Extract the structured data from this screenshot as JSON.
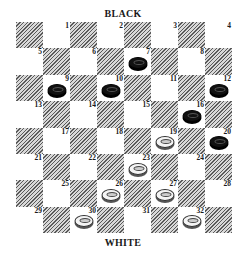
{
  "labels": {
    "top": "BLACK",
    "bottom": "WHITE"
  },
  "board": {
    "size": 8,
    "colors": {
      "dark_hatch": "#5a5a5a",
      "light": "#ffffff",
      "black_piece": "#111111",
      "white_piece": "#f4f4f4"
    },
    "squares": [
      {
        "row": 0,
        "col": 0,
        "dark": true
      },
      {
        "row": 0,
        "col": 1,
        "num": "1"
      },
      {
        "row": 0,
        "col": 2,
        "dark": true
      },
      {
        "row": 0,
        "col": 3,
        "num": "2"
      },
      {
        "row": 0,
        "col": 4,
        "dark": true
      },
      {
        "row": 0,
        "col": 5,
        "num": "3"
      },
      {
        "row": 0,
        "col": 6,
        "dark": true
      },
      {
        "row": 0,
        "col": 7,
        "num": "4"
      },
      {
        "row": 1,
        "col": 0,
        "num": "5"
      },
      {
        "row": 1,
        "col": 1,
        "dark": true
      },
      {
        "row": 1,
        "col": 2,
        "num": "6"
      },
      {
        "row": 1,
        "col": 3,
        "dark": true
      },
      {
        "row": 1,
        "col": 4,
        "num": "7",
        "piece": "black"
      },
      {
        "row": 1,
        "col": 5,
        "dark": true
      },
      {
        "row": 1,
        "col": 6,
        "num": "8"
      },
      {
        "row": 1,
        "col": 7,
        "dark": true
      },
      {
        "row": 2,
        "col": 0,
        "dark": true
      },
      {
        "row": 2,
        "col": 1,
        "num": "9",
        "piece": "black"
      },
      {
        "row": 2,
        "col": 2,
        "dark": true
      },
      {
        "row": 2,
        "col": 3,
        "num": "10",
        "piece": "black"
      },
      {
        "row": 2,
        "col": 4,
        "dark": true
      },
      {
        "row": 2,
        "col": 5,
        "num": "11"
      },
      {
        "row": 2,
        "col": 6,
        "dark": true
      },
      {
        "row": 2,
        "col": 7,
        "num": "12",
        "piece": "black"
      },
      {
        "row": 3,
        "col": 0,
        "num": "13"
      },
      {
        "row": 3,
        "col": 1,
        "dark": true
      },
      {
        "row": 3,
        "col": 2,
        "num": "14"
      },
      {
        "row": 3,
        "col": 3,
        "dark": true
      },
      {
        "row": 3,
        "col": 4,
        "num": "15"
      },
      {
        "row": 3,
        "col": 5,
        "dark": true
      },
      {
        "row": 3,
        "col": 6,
        "num": "16",
        "piece": "black"
      },
      {
        "row": 3,
        "col": 7,
        "dark": true
      },
      {
        "row": 4,
        "col": 0,
        "dark": true
      },
      {
        "row": 4,
        "col": 1,
        "num": "17"
      },
      {
        "row": 4,
        "col": 2,
        "dark": true
      },
      {
        "row": 4,
        "col": 3,
        "num": "18"
      },
      {
        "row": 4,
        "col": 4,
        "dark": true
      },
      {
        "row": 4,
        "col": 5,
        "num": "19",
        "piece": "white"
      },
      {
        "row": 4,
        "col": 6,
        "dark": true
      },
      {
        "row": 4,
        "col": 7,
        "num": "20",
        "piece": "black"
      },
      {
        "row": 5,
        "col": 0,
        "num": "21"
      },
      {
        "row": 5,
        "col": 1,
        "dark": true
      },
      {
        "row": 5,
        "col": 2,
        "num": "22"
      },
      {
        "row": 5,
        "col": 3,
        "dark": true
      },
      {
        "row": 5,
        "col": 4,
        "num": "23",
        "piece": "white"
      },
      {
        "row": 5,
        "col": 5,
        "dark": true
      },
      {
        "row": 5,
        "col": 6,
        "num": "24"
      },
      {
        "row": 5,
        "col": 7,
        "dark": true
      },
      {
        "row": 6,
        "col": 0,
        "dark": true
      },
      {
        "row": 6,
        "col": 1,
        "num": "25"
      },
      {
        "row": 6,
        "col": 2,
        "dark": true
      },
      {
        "row": 6,
        "col": 3,
        "num": "26",
        "piece": "white"
      },
      {
        "row": 6,
        "col": 4,
        "dark": true
      },
      {
        "row": 6,
        "col": 5,
        "num": "27",
        "piece": "white"
      },
      {
        "row": 6,
        "col": 6,
        "dark": true
      },
      {
        "row": 6,
        "col": 7,
        "num": "28"
      },
      {
        "row": 7,
        "col": 0,
        "num": "29"
      },
      {
        "row": 7,
        "col": 1,
        "dark": true
      },
      {
        "row": 7,
        "col": 2,
        "num": "30",
        "piece": "white"
      },
      {
        "row": 7,
        "col": 3,
        "dark": true
      },
      {
        "row": 7,
        "col": 4,
        "num": "31"
      },
      {
        "row": 7,
        "col": 5,
        "dark": true
      },
      {
        "row": 7,
        "col": 6,
        "num": "32",
        "piece": "white"
      },
      {
        "row": 7,
        "col": 7,
        "dark": true
      }
    ],
    "black_pieces": [
      "7",
      "9",
      "10",
      "12",
      "16",
      "20"
    ],
    "white_pieces": [
      "19",
      "23",
      "26",
      "27",
      "30",
      "32"
    ]
  }
}
